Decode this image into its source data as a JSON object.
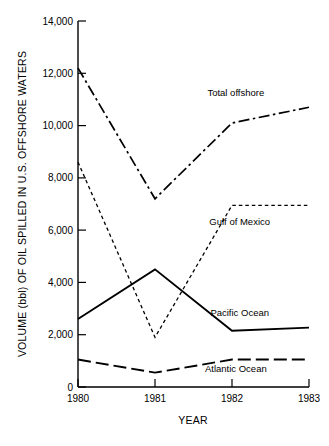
{
  "chart_data": {
    "type": "line",
    "title": "",
    "xlabel": "YEAR",
    "ylabel": "VOLUME (bbl) OF OIL SPILLED IN U.S. OFFSHORE WATERS",
    "x": [
      1980,
      1981,
      1982,
      1983
    ],
    "categories": [
      "1980",
      "1981",
      "1982",
      "1983"
    ],
    "xlim": [
      1980,
      1983
    ],
    "ylim": [
      0,
      14000
    ],
    "y_ticks": [
      0,
      2000,
      4000,
      6000,
      8000,
      10000,
      12000,
      14000
    ],
    "y_tick_labels": [
      "0",
      "2,000",
      "4,000",
      "6,000",
      "8,000",
      "10,000",
      "12,000",
      "14,000"
    ],
    "x_ticks": [
      1980,
      1981,
      1982,
      1983
    ],
    "x_tick_labels": [
      "1980",
      "1981",
      "1982",
      "1983"
    ],
    "grid": false,
    "legend_position": "inline-right-of-series",
    "series": [
      {
        "name": "Total offshore",
        "line_style": "dash-dot",
        "color": "#000000",
        "values": [
          12200,
          7200,
          10100,
          10700
        ],
        "label_x": 1982.05,
        "label_y": 11150
      },
      {
        "name": "Gulf of Mexico",
        "line_style": "dashed",
        "color": "#000000",
        "values": [
          8600,
          1900,
          6950,
          6950
        ],
        "label_x": 1982.1,
        "label_y": 6180
      },
      {
        "name": "Pacific Ocean",
        "line_style": "solid",
        "color": "#000000",
        "values": [
          2600,
          4500,
          2150,
          2270
        ],
        "label_x": 1982.1,
        "label_y": 2720
      },
      {
        "name": "Atlantic Ocean",
        "line_style": "long-dash",
        "color": "#000000",
        "values": [
          1050,
          550,
          1050,
          1050
        ],
        "label_x": 1982.05,
        "label_y": 560
      }
    ]
  },
  "axis": {
    "y_title": "VOLUME (bbl) OF OIL SPILLED IN U.S. OFFSHORE WATERS",
    "x_title": "YEAR",
    "y_labels": {
      "t0": "0",
      "t1": "2,000",
      "t2": "4,000",
      "t3": "6,000",
      "t4": "8,000",
      "t5": "10,000",
      "t6": "12,000",
      "t7": "14,000"
    },
    "x_labels": {
      "x0": "1980",
      "x1": "1981",
      "x2": "1982",
      "x3": "1983"
    }
  },
  "series_labels": {
    "total_offshore": "Total offshore",
    "gulf_of_mexico": "Gulf of Mexico",
    "pacific_ocean": "Pacific Ocean",
    "atlantic_ocean": "Atlantic Ocean"
  },
  "colors": {
    "ink": "#000000",
    "background": "#ffffff"
  }
}
